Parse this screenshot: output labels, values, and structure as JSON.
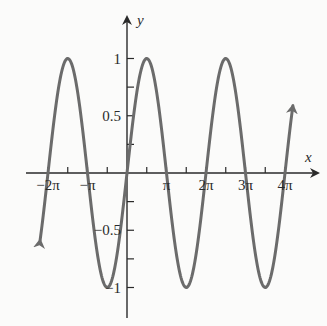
{
  "chart_data": {
    "type": "line",
    "title": "",
    "function": "y = sin(x)",
    "xlabel": "x",
    "ylabel": "y",
    "x_range": [
      -2.2,
      4.2
    ],
    "x_unit": "pi",
    "xlim_pi": [
      -2.25,
      4.65
    ],
    "ylim": [
      -1.3,
      1.35
    ],
    "x_ticks_pi": [
      -2,
      -1.5,
      -1,
      -0.5,
      0,
      0.5,
      1,
      1.5,
      2,
      2.5,
      3,
      3.5,
      4
    ],
    "x_tick_labels": [
      {
        "at": -2,
        "label": "−2π"
      },
      {
        "at": -1,
        "label": "−π"
      },
      {
        "at": 1,
        "label": "π"
      },
      {
        "at": 2,
        "label": "2π"
      },
      {
        "at": 3,
        "label": "3π"
      },
      {
        "at": 4,
        "label": "4π"
      }
    ],
    "y_ticks": [
      -1,
      -0.75,
      -0.5,
      -0.25,
      0.25,
      0.5,
      0.75,
      1
    ],
    "y_tick_labels": [
      {
        "at": 1,
        "label": "1"
      },
      {
        "at": 0.5,
        "label": "0.5"
      },
      {
        "at": -0.5,
        "label": "−0.5"
      },
      {
        "at": -1,
        "label": "−1"
      }
    ],
    "key_points": {
      "zeros_pi": [
        -2,
        -1,
        0,
        1,
        2,
        3,
        4
      ],
      "maxima_pi": [
        -1.5,
        0.5,
        2.5
      ],
      "minima_pi": [
        -0.5,
        1.5,
        3.5
      ],
      "max_value": 1,
      "min_value": -1
    },
    "grid": false,
    "legend": null,
    "curve_color": "#6b6b6b",
    "axis_color": "#2a2a2a",
    "arrows_on_curve_ends": true
  },
  "layout": {
    "origin_px": [
      127,
      173
    ],
    "px_per_pi": 39.5,
    "px_per_unit_y": 114.5
  }
}
